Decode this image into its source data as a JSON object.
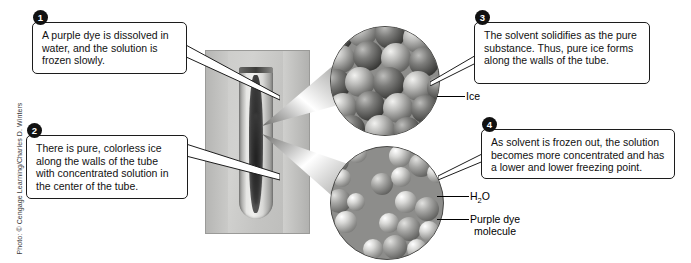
{
  "figure": {
    "credit": "Photo: © Cengage Learning/Charles D. Winters"
  },
  "callouts": [
    {
      "number": "1",
      "text": "A purple dye is dissolved in water, and the solution is frozen slowly."
    },
    {
      "number": "2",
      "text": "There is pure, colorless ice along the walls of the tube with concentrated solution in the center of the tube."
    },
    {
      "number": "3",
      "text": "The solvent solidifies as the pure substance. Thus, pure ice forms along the walls of the tube."
    },
    {
      "number": "4",
      "text": "As solvent is frozen out, the solution becomes more concentrated and has a lower and lower freezing point."
    }
  ],
  "labels": {
    "ice": "Ice",
    "water_prefix": "H",
    "water_sub": "2",
    "water_suffix": "O",
    "dye_line1": "Purple dye",
    "dye_line2": "molecule"
  },
  "insets": {
    "top": "crystal-lattice-ice-inset",
    "bottom": "liquid-solution-inset"
  },
  "photo": {
    "subject": "test-tube-with-frozen-purple-dye-solution"
  },
  "colors": {
    "box_border": "#1c1c1c",
    "badge_bg": "#111111",
    "badge_text": "#ffffff",
    "background": "#ffffff"
  }
}
